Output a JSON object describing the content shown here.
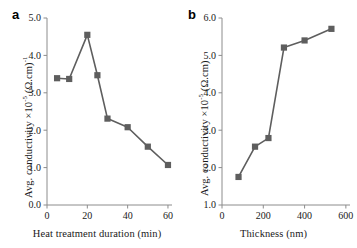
{
  "figure": {
    "background": "#ffffff",
    "series_color": "#5e5e5e",
    "axis_color": "#8c8c8c"
  },
  "panels": {
    "a": {
      "letter": "a",
      "xlabel": "Heat treatment duration (min)",
      "ylabel_prefix": "Avg. conductivity  ×10",
      "ylabel_exp": "-5",
      "ylabel_unit": " (Ω.cm)",
      "ylabel_unit_exp": "-1",
      "xticks": [
        "0",
        "20",
        "40",
        "60"
      ],
      "yticks": [
        "0.0",
        "1.0",
        "2.0",
        "3.0",
        "4.0",
        "5.0"
      ]
    },
    "b": {
      "letter": "b",
      "xlabel": "Thickness (nm)",
      "ylabel_prefix": "Avg. conductivity  ×10",
      "ylabel_exp": "-5",
      "ylabel_unit": " (Ω.cm)",
      "xticks": [
        "0",
        "200",
        "400",
        "600"
      ],
      "yticks": [
        "1.0",
        "2.0",
        "3.0",
        "4.0",
        "5.0",
        "6.0"
      ]
    }
  },
  "chart_data": [
    {
      "type": "line",
      "panel": "a",
      "title": "a",
      "xlabel": "Heat treatment duration (min)",
      "ylabel": "Avg. conductivity ×10⁻⁵ (Ω.cm)⁻¹",
      "x": [
        5,
        11,
        20,
        25,
        30,
        40,
        50,
        60
      ],
      "values": [
        3.39,
        3.37,
        4.55,
        3.47,
        2.31,
        2.08,
        1.56,
        1.07
      ],
      "xlim": [
        0,
        62
      ],
      "ylim": [
        0.0,
        5.0
      ],
      "xticks": [
        0,
        20,
        40,
        60
      ],
      "yticks": [
        0.0,
        1.0,
        2.0,
        3.0,
        4.0,
        5.0
      ],
      "grid": false,
      "legend": false,
      "marker": "square",
      "color": "#5e5e5e"
    },
    {
      "type": "line",
      "panel": "b",
      "title": "b",
      "xlabel": "Thickness (nm)",
      "ylabel": "Avg. conductivity ×10⁻⁵ (Ω.cm)",
      "x": [
        80,
        160,
        225,
        300,
        400,
        530
      ],
      "values": [
        1.75,
        2.56,
        2.79,
        5.21,
        5.4,
        5.71
      ],
      "xlim": [
        0,
        620
      ],
      "ylim": [
        1.0,
        6.0
      ],
      "xticks": [
        0,
        200,
        400,
        600
      ],
      "yticks": [
        1.0,
        2.0,
        3.0,
        4.0,
        5.0,
        6.0
      ],
      "grid": false,
      "legend": false,
      "marker": "square",
      "color": "#5e5e5e"
    }
  ]
}
